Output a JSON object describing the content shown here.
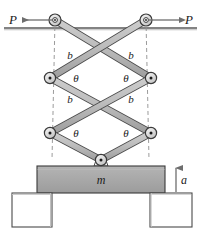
{
  "figure": {
    "labels": {
      "force_left": "P",
      "force_right": "P",
      "link_upper_left": "b",
      "link_upper_right": "b",
      "link_lower_left": "b",
      "link_lower_right": "b",
      "angle_mid_left": "θ",
      "angle_mid_right": "θ",
      "angle_low_left": "θ",
      "angle_low_right": "θ",
      "mass": "m",
      "acceleration": "a"
    },
    "colors": {
      "link_fill": "#b8b8b8",
      "link_stroke": "#4a4a4a",
      "block_fill": "#a9a9a9",
      "block_stroke": "#3a3a3a",
      "support_fill": "#ffffff",
      "support_stroke": "#4a4a4a",
      "ceiling_stroke": "#5a5a5a",
      "guide_stroke": "#8a8a8a",
      "pin_outer": "#d8d8d8",
      "pin_stroke": "#3a3a3a",
      "text": "#1a1a1a"
    },
    "geometry": {
      "pivots": {
        "top_left": [
          55,
          20
        ],
        "top_right": [
          146,
          20
        ],
        "mid_left": [
          50,
          78
        ],
        "mid_right": [
          151,
          78
        ],
        "low_left": [
          50,
          133
        ],
        "low_right": [
          151,
          133
        ],
        "bottom_center": [
          101,
          160
        ]
      },
      "ceiling_y": 28,
      "block": {
        "x": 37,
        "y": 166,
        "w": 128,
        "h": 27
      },
      "support_left": {
        "x": 12,
        "y": 193,
        "w": 40,
        "h": 34
      },
      "support_right": {
        "x": 150,
        "y": 193,
        "w": 42,
        "h": 34
      }
    }
  }
}
